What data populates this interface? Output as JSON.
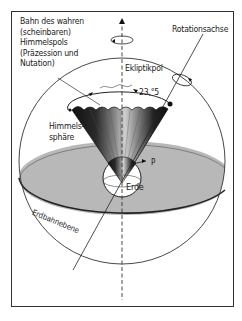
{
  "figure": {
    "labels": {
      "bahn": "Bahn des wahren\n(scheinbaren)\nHimmelspols\n(Präzession und\nNutation)",
      "rotationsachse": "Rotationsachse",
      "ekliptikpol": "Ekliptikpol",
      "angle": "23,°5",
      "himmelssphaere": "Himmels-\nsphäre",
      "p": "P",
      "erde": "Erde",
      "erdbahnebene": "Erdbahnebene"
    },
    "colors": {
      "frame": "#333333",
      "plane_fill": "#b5b5b5",
      "cone_dark": "#1e1e1e",
      "line": "#2a2a2a",
      "background": "#ffffff"
    }
  }
}
